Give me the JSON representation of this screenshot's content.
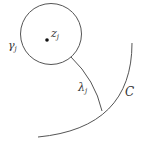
{
  "diagram": {
    "labels": {
      "circle": {
        "main": "γ",
        "sub": "j"
      },
      "center": {
        "main": "z",
        "sub": "j"
      },
      "path": {
        "main": "λ",
        "sub": "j"
      },
      "contour": {
        "main": "C"
      }
    },
    "colors": {
      "stroke": "#555555",
      "text": "#333333",
      "background": "#ffffff"
    }
  }
}
